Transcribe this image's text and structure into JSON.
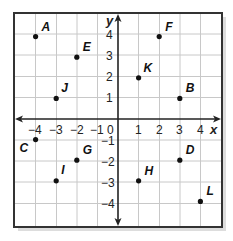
{
  "grid": {
    "x_min": -4,
    "x_max": 4,
    "y_min": -4,
    "y_max": 4,
    "colors": {
      "gridline": "#c8c8c8",
      "axis": "#222222",
      "frame": "#333333",
      "point": "#111111",
      "shadow": "#bdbdbd"
    }
  },
  "axes": {
    "x_label": "x",
    "y_label": "y",
    "x_ticks": [
      "−4",
      "−3",
      "−2",
      "−1",
      "1",
      "2",
      "3",
      "4"
    ],
    "y_ticks": [
      "4",
      "3",
      "2",
      "1",
      "−1",
      "−2",
      "−3",
      "−4"
    ],
    "origin_label": "0"
  },
  "points": [
    {
      "label": "A",
      "x": -4,
      "y": 4
    },
    {
      "label": "E",
      "x": -2,
      "y": 3
    },
    {
      "label": "J",
      "x": -3,
      "y": 1
    },
    {
      "label": "F",
      "x": 2,
      "y": 4
    },
    {
      "label": "K",
      "x": 1,
      "y": 2
    },
    {
      "label": "B",
      "x": 3,
      "y": 1
    },
    {
      "label": "C",
      "x": -4,
      "y": -1
    },
    {
      "label": "G",
      "x": -2,
      "y": -2
    },
    {
      "label": "I",
      "x": -3,
      "y": -3
    },
    {
      "label": "H",
      "x": 1,
      "y": -3
    },
    {
      "label": "D",
      "x": 3,
      "y": -2
    },
    {
      "label": "L",
      "x": 4,
      "y": -4
    }
  ]
}
